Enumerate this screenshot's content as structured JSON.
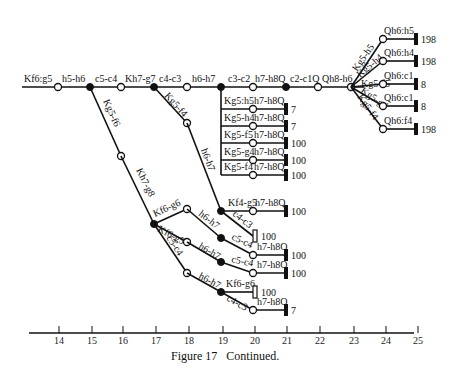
{
  "figure": {
    "caption": "Figure 17   Continued.",
    "axis": {
      "ticks": [
        "14",
        "15",
        "16",
        "17",
        "18",
        "19",
        "20",
        "21",
        "22",
        "23",
        "24",
        "25"
      ]
    },
    "main_line": {
      "moves": [
        "Kf6:g5",
        "h5-h6",
        "c5-c4",
        "Kh7-g7",
        "c4-c3",
        "h6-h7",
        "c3-c2",
        "h7-h8Q",
        "c2-c1Q",
        "Qh8-h6"
      ]
    },
    "fan_branches": [
      {
        "move": "Kg5-h5",
        "reply": "Qh6:h5",
        "value": "198"
      },
      {
        "move": "Kg5-h4",
        "reply": "Qh6:h4",
        "value": "198"
      },
      {
        "move": "Kg5-f5",
        "reply": "Qh6:c1",
        "value": "8"
      },
      {
        "move": "Kg5-g4",
        "reply": "Qh6:c1",
        "value": "8"
      },
      {
        "move": "Kg5-f4",
        "reply": "Qh6:f4",
        "value": "198"
      }
    ],
    "c3c2_branches": [
      {
        "move": "Kg5:h5",
        "reply": "h7-h8Q",
        "value": "7"
      },
      {
        "move": "Kg5-h4",
        "reply": "h7-h8Q",
        "value": "7"
      },
      {
        "move": "Kg5-f5",
        "reply": "h7-h8Q",
        "value": "100"
      },
      {
        "move": "Kg5-g4",
        "reply": "h7-h8Q",
        "value": "100"
      },
      {
        "move": "Kg5-f4",
        "reply": "h7-h8Q",
        "value": "100"
      }
    ],
    "kg5f4_branch": {
      "move1": "Kg5-f4",
      "move2": "h6-h7",
      "sub1": {
        "move": "Kf4-g5",
        "reply": "h7-h8Q",
        "value": "100"
      },
      "sub2": {
        "move": "c4-c3",
        "value": "100"
      }
    },
    "kg5f6_branch": {
      "move1": "Kg5-f6",
      "move2": "Kh7-g8",
      "a": {
        "move": "Kf6-g6",
        "next": "h6-h7",
        "then": "c5-c4",
        "reply": "h7-h8Q",
        "value": "100"
      },
      "b": {
        "move": "Kf6-g5",
        "next": "h6-h7",
        "then": "c5-c4",
        "reply": "h7-h8Q",
        "value": "100"
      },
      "c": {
        "move": "c5-c4",
        "next": "h6-h7",
        "sub1": {
          "move": "Kf6-g6",
          "value": "100"
        },
        "sub2": {
          "move": "c4-c3",
          "reply": "h7-h8Q",
          "value": "7"
        }
      }
    }
  }
}
